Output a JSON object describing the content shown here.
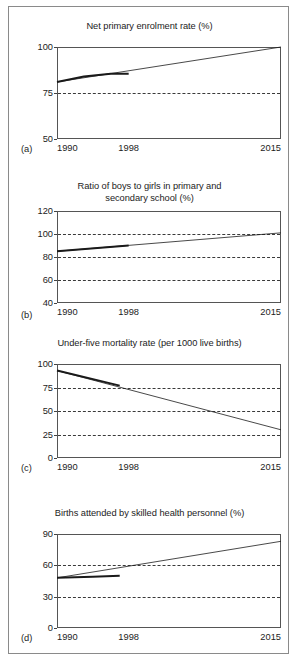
{
  "figure": {
    "border_color": "#8a8a8a",
    "background": "#ffffff",
    "line_color": "#1a1a1a"
  },
  "chart_data": [
    {
      "id": "a",
      "tag": "(a)",
      "type": "line",
      "title": "Net primary enrolment rate (%)",
      "xlabel": "",
      "ylabel": "",
      "xlim": [
        1990,
        2015
      ],
      "ylim": [
        50,
        100
      ],
      "yticks": [
        50,
        75,
        100
      ],
      "ytick_labels": [
        "50",
        "75",
        "100"
      ],
      "gridlines": [
        75
      ],
      "grid": true,
      "xticks": [
        1990,
        1998,
        2015
      ],
      "xtick_labels": [
        "1990",
        "1998",
        "2015"
      ],
      "legend": "none",
      "series": [
        {
          "name": "observed-trend",
          "style": "thick",
          "x": [
            1990,
            1993,
            1996,
            1998
          ],
          "values": [
            81,
            84,
            85.5,
            85.5
          ]
        },
        {
          "name": "target-path",
          "style": "thin",
          "x": [
            1990,
            2015
          ],
          "values": [
            81,
            100
          ]
        }
      ]
    },
    {
      "id": "b",
      "tag": "(b)",
      "type": "line",
      "title": "Ratio of boys to girls in primary and secondary school (%)",
      "title_lines": [
        "Ratio of boys to girls in primary and",
        "secondary school (%)"
      ],
      "xlabel": "",
      "ylabel": "",
      "xlim": [
        1990,
        2015
      ],
      "ylim": [
        40,
        120
      ],
      "yticks": [
        40,
        60,
        80,
        100,
        120
      ],
      "ytick_labels": [
        "40",
        "60",
        "80",
        "100",
        "120"
      ],
      "gridlines": [
        60,
        80,
        100
      ],
      "grid": true,
      "xticks": [
        1990,
        1998,
        2015
      ],
      "xtick_labels": [
        "1990",
        "1998",
        "2015"
      ],
      "legend": "none",
      "series": [
        {
          "name": "observed-trend",
          "style": "thick",
          "x": [
            1990,
            1998
          ],
          "values": [
            85,
            90
          ]
        },
        {
          "name": "target-path",
          "style": "thin",
          "x": [
            1990,
            2015
          ],
          "values": [
            85,
            101
          ]
        }
      ]
    },
    {
      "id": "c",
      "tag": "(c)",
      "type": "line",
      "title": "Under-five mortality rate (per 1000 live births)",
      "xlabel": "",
      "ylabel": "",
      "xlim": [
        1990,
        2015
      ],
      "ylim": [
        0,
        100
      ],
      "yticks": [
        0,
        25,
        50,
        75,
        100
      ],
      "ytick_labels": [
        "0",
        "25",
        "50",
        "75",
        "100"
      ],
      "gridlines": [
        25,
        50,
        75
      ],
      "grid": true,
      "xticks": [
        1990,
        1998,
        2015
      ],
      "xtick_labels": [
        "1990",
        "1998",
        "2015"
      ],
      "legend": "none",
      "series": [
        {
          "name": "observed-trend",
          "style": "thick",
          "x": [
            1990,
            1997
          ],
          "values": [
            93,
            77
          ]
        },
        {
          "name": "target-path",
          "style": "thin",
          "x": [
            1990,
            2015
          ],
          "values": [
            93,
            30
          ]
        }
      ]
    },
    {
      "id": "d",
      "tag": "(d)",
      "type": "line",
      "title": "Births attended by skilled health personnel (%)",
      "xlabel": "",
      "ylabel": "",
      "xlim": [
        1990,
        2015
      ],
      "ylim": [
        0,
        90
      ],
      "yticks": [
        0,
        30,
        60,
        90
      ],
      "ytick_labels": [
        "0",
        "30",
        "60",
        "90"
      ],
      "gridlines": [
        30,
        60
      ],
      "grid": true,
      "xticks": [
        1990,
        1998,
        2015
      ],
      "xtick_labels": [
        "1990",
        "1998",
        "2015"
      ],
      "legend": "none",
      "series": [
        {
          "name": "observed-trend",
          "style": "thick",
          "x": [
            1990,
            1994,
            1997
          ],
          "values": [
            48,
            49,
            50
          ]
        },
        {
          "name": "target-path",
          "style": "thin",
          "x": [
            1990,
            2015
          ],
          "values": [
            48,
            83
          ]
        }
      ]
    }
  ]
}
